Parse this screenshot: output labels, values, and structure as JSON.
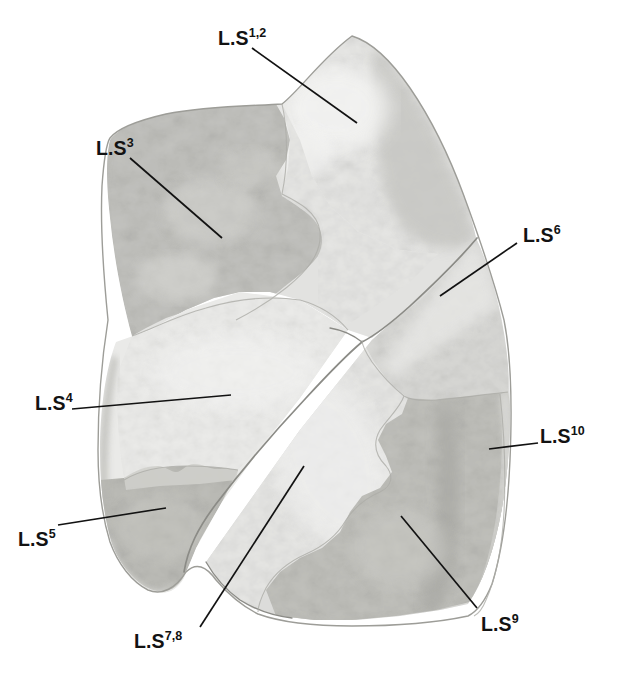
{
  "figure": {
    "kind": "anatomical-photograph",
    "background_color": "#ffffff",
    "ink_color": "#121212"
  },
  "palette": {
    "outline": "#9a9a9a",
    "fissure_line": "#8d8d8d",
    "tone_lightest": "#efefee",
    "tone_light": "#e4e4e2",
    "tone_pale": "#dcdcda",
    "tone_mid_light": "#d2d2cf",
    "tone_mid": "#c6c6c2",
    "tone_mid_dark": "#bcbcb7",
    "tone_dark": "#b0b0ab",
    "tone_darkest": "#a3a39d",
    "leader_color": "#121212"
  },
  "labels": [
    {
      "id": "ls12",
      "base": "L.S",
      "superscript": "1,2",
      "name": "apicoposterior segment",
      "text_x": 218,
      "text_y": 27,
      "leader": {
        "x1": 252,
        "y1": 48,
        "x2": 357,
        "y2": 123
      }
    },
    {
      "id": "ls3",
      "base": "L.S",
      "superscript": "3",
      "name": "anterior segment",
      "text_x": 96,
      "text_y": 137,
      "leader": {
        "x1": 130,
        "y1": 158,
        "x2": 222,
        "y2": 238
      }
    },
    {
      "id": "ls6",
      "base": "L.S",
      "superscript": "6",
      "name": "superior segment of lower lobe",
      "text_x": 523,
      "text_y": 224,
      "leader": {
        "x1": 517,
        "y1": 243,
        "x2": 440,
        "y2": 296
      }
    },
    {
      "id": "ls4",
      "base": "L.S",
      "superscript": "4",
      "name": "superior lingular segment",
      "text_x": 35,
      "text_y": 392,
      "leader": {
        "x1": 72,
        "y1": 409,
        "x2": 231,
        "y2": 395
      }
    },
    {
      "id": "ls10",
      "base": "L.S",
      "superscript": "10",
      "name": "posterior basal segment",
      "text_x": 540,
      "text_y": 425,
      "leader": {
        "x1": 538,
        "y1": 443,
        "x2": 489,
        "y2": 449
      }
    },
    {
      "id": "ls5",
      "base": "L.S",
      "superscript": "5",
      "name": "inferior lingular segment",
      "text_x": 18,
      "text_y": 528,
      "leader": {
        "x1": 58,
        "y1": 525,
        "x2": 166,
        "y2": 508
      }
    },
    {
      "id": "ls78",
      "base": "L.S",
      "superscript": "7,8",
      "name": "anterior basal segment",
      "text_x": 134,
      "text_y": 630,
      "leader": {
        "x1": 200,
        "y1": 627,
        "x2": 304,
        "y2": 466
      }
    },
    {
      "id": "ls9",
      "base": "L.S",
      "superscript": "9",
      "name": "lateral basal segment",
      "text_x": 481,
      "text_y": 613,
      "leader": {
        "x1": 477,
        "y1": 608,
        "x2": 401,
        "y2": 516
      }
    }
  ],
  "regions": [
    {
      "id": "upper-lobe-body",
      "tone": "#e2e2e0",
      "label_ref": "ls12"
    },
    {
      "id": "apical-highlight",
      "tone": "#efefee",
      "label_ref": "ls12"
    },
    {
      "id": "apex-shadow",
      "tone": "#c9c9c5",
      "label_ref": "ls12"
    },
    {
      "id": "anterior-segment",
      "tone": "#c3c3bf",
      "label_ref": "ls3"
    },
    {
      "id": "superior-lingula",
      "tone": "#eaeae8",
      "label_ref": "ls4"
    },
    {
      "id": "inferior-lingula",
      "tone": "#bdbdb8",
      "label_ref": "ls5"
    },
    {
      "id": "lower-lobe-body",
      "tone": "#dcdcda",
      "label_ref": "ls78"
    },
    {
      "id": "superior-basal",
      "tone": "#d6d6d3",
      "label_ref": "ls6"
    },
    {
      "id": "lateral-basal",
      "tone": "#bfbfba",
      "label_ref": "ls9"
    },
    {
      "id": "posterior-basal",
      "tone": "#cccac6",
      "label_ref": "ls10"
    }
  ]
}
